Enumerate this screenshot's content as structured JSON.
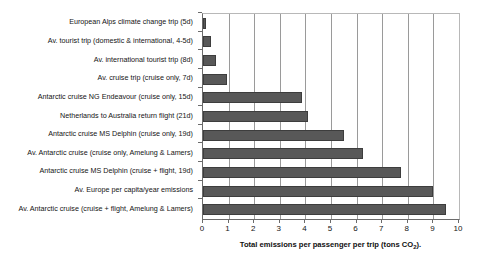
{
  "chart_data": {
    "type": "bar",
    "orientation": "horizontal",
    "title": "",
    "xlabel": "Total emissions per passenger per trip (tons CO2)",
    "xlabel_prefix": "Total emissions per passenger per trip (tons CO",
    "xlabel_subscript": "2",
    "xlabel_suffix": ").",
    "ylabel": "",
    "xlim": [
      0,
      10
    ],
    "xticks": [
      0,
      1,
      2,
      3,
      4,
      5,
      6,
      7,
      8,
      9,
      10
    ],
    "xtick_labels": [
      "0",
      "1",
      "2",
      "3",
      "4",
      "5",
      "6",
      "7",
      "8",
      "9",
      "10"
    ],
    "grid": "vertical",
    "legend": "none",
    "bar_color": "#585858",
    "bar_edge_color": "#3d3d3d",
    "background": "#ffffff",
    "categories": [
      "European Alps climate change trip (5d)",
      "Av. tourist trip (domestic & international, 4-5d)",
      "Av. international tourist trip (8d)",
      "Av. cruise trip (cruise only, 7d)",
      "Antarctic cruise NG Endeavour (cruise only, 15d)",
      "Netherlands to Australia return flight (21d)",
      "Antarctic cruise MS Delphin (cruise only, 19d)",
      "Av. Antarctic cruise (cruise only, Amelung & Lamers)",
      "Antarctic cruise MS Delphin (cruise + flight, 19d)",
      "Av. Europe per capita/year emissions",
      "Av. Antarctic cruise (cruise + flight, Amelung & Lamers)"
    ],
    "values": [
      0.1,
      0.3,
      0.5,
      0.95,
      3.85,
      4.1,
      5.5,
      6.25,
      7.75,
      9.0,
      9.5
    ]
  }
}
